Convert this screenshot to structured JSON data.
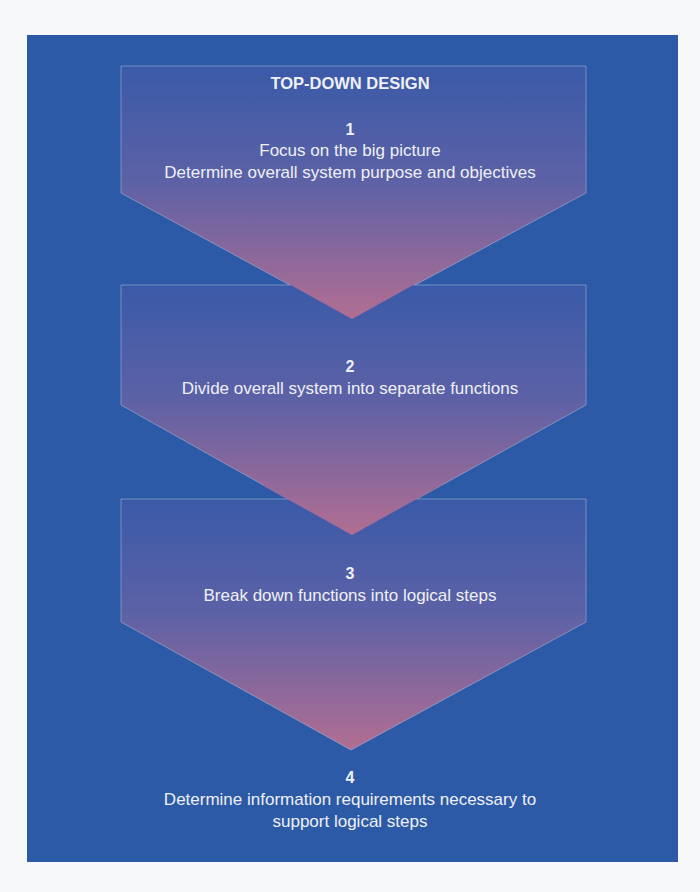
{
  "diagram": {
    "title": "TOP-DOWN DESIGN",
    "colors": {
      "background": "#2c5aa6",
      "arrow_gradient_end": "#b06e92",
      "text": "#eef0f6",
      "outline": "#aab8dc"
    },
    "steps": [
      {
        "number": "1",
        "line1": "Focus on the big picture",
        "line2": "Determine overall system purpose and objectives"
      },
      {
        "number": "2",
        "line1": "Divide overall system into separate functions"
      },
      {
        "number": "3",
        "line1": "Break down functions into logical steps"
      },
      {
        "number": "4",
        "line1": "Determine information requirements necessary to",
        "line2": "support logical steps"
      }
    ]
  }
}
